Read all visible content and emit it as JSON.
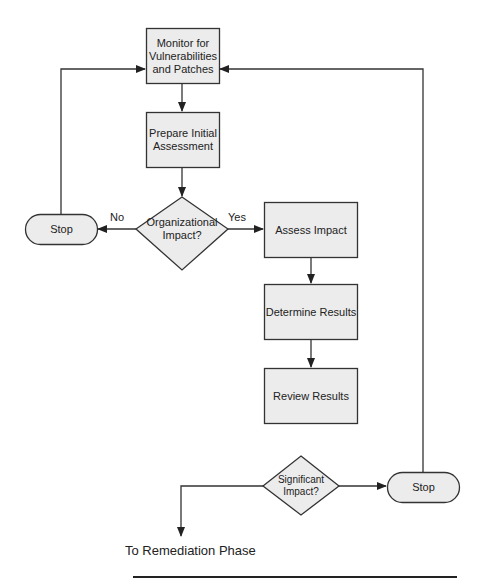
{
  "diagram": {
    "type": "flowchart",
    "nodes": {
      "monitor": {
        "label": "Monitor for Vulnerabilities and Patches",
        "lines": [
          "Monitor for",
          "Vulnerabilities",
          "and Patches"
        ],
        "shape": "rectangle"
      },
      "prepare": {
        "label": "Prepare Initial Assessment",
        "lines": [
          "Prepare Initial",
          "Assessment"
        ],
        "shape": "rectangle"
      },
      "org_impact": {
        "label": "Organizational Impact?",
        "lines": [
          "Organizational",
          "Impact?"
        ],
        "shape": "diamond"
      },
      "stop_left": {
        "label": "Stop",
        "shape": "terminator"
      },
      "assess": {
        "label": "Assess Impact",
        "shape": "rectangle"
      },
      "determine": {
        "label": "Determine Results",
        "shape": "rectangle"
      },
      "review": {
        "label": "Review Results",
        "shape": "rectangle"
      },
      "sig_impact": {
        "label": "Significant Impact?",
        "lines": [
          "Significant",
          "Impact?"
        ],
        "shape": "diamond"
      },
      "stop_right": {
        "label": "Stop",
        "shape": "terminator"
      }
    },
    "edges": [
      {
        "from": "monitor",
        "to": "prepare",
        "label": ""
      },
      {
        "from": "prepare",
        "to": "org_impact",
        "label": ""
      },
      {
        "from": "org_impact",
        "to": "stop_left",
        "label": "No"
      },
      {
        "from": "org_impact",
        "to": "assess",
        "label": "Yes"
      },
      {
        "from": "stop_left",
        "to": "monitor",
        "label": ""
      },
      {
        "from": "assess",
        "to": "determine",
        "label": ""
      },
      {
        "from": "determine",
        "to": "review",
        "label": ""
      },
      {
        "from": "sig_impact",
        "to": "stop_right",
        "label": ""
      },
      {
        "from": "sig_impact",
        "to": "remediation",
        "label": ""
      },
      {
        "from": "stop_right",
        "to": "monitor",
        "label": ""
      }
    ],
    "edge_labels": {
      "no": "No",
      "yes": "Yes"
    },
    "exit_label": "To Remediation Phase",
    "colors": {
      "node_fill": "#ececec",
      "stroke": "#333333",
      "background": "#ffffff"
    }
  }
}
